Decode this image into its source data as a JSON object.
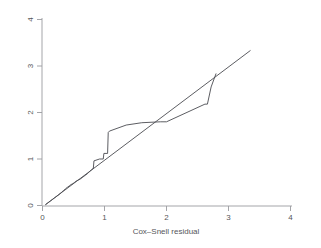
{
  "figure": {
    "background_color": "#ffffff",
    "axis_color": "#9a9b9f",
    "line_color": "#4a4b50"
  },
  "axes": {
    "x_title": "Cox–Snell residual",
    "y_title": "",
    "x_ticks": [
      "0",
      "1",
      "2",
      "3",
      "4"
    ],
    "y_ticks": [
      "0",
      "1",
      "2",
      "3",
      "4"
    ]
  },
  "chart_data": {
    "type": "line",
    "title": "",
    "subtitle": "",
    "xlabel": "Cox–Snell residual",
    "ylabel": "",
    "xlim": [
      0,
      4
    ],
    "ylim": [
      0,
      4
    ],
    "xticks": [
      0,
      1,
      2,
      3,
      4
    ],
    "yticks": [
      0,
      1,
      2,
      3,
      4
    ],
    "grid": false,
    "legend": "none",
    "series": [
      {
        "name": "Nelson-Aalen cumulative hazard (step)",
        "style": "step",
        "points": [
          [
            0.05,
            0.02
          ],
          [
            0.08,
            0.05
          ],
          [
            0.1,
            0.07
          ],
          [
            0.13,
            0.1
          ],
          [
            0.16,
            0.13
          ],
          [
            0.19,
            0.16
          ],
          [
            0.22,
            0.19
          ],
          [
            0.25,
            0.22
          ],
          [
            0.28,
            0.25
          ],
          [
            0.31,
            0.29
          ],
          [
            0.34,
            0.32
          ],
          [
            0.37,
            0.36
          ],
          [
            0.4,
            0.39
          ],
          [
            0.43,
            0.42
          ],
          [
            0.46,
            0.45
          ],
          [
            0.49,
            0.47
          ],
          [
            0.52,
            0.5
          ],
          [
            0.55,
            0.53
          ],
          [
            0.58,
            0.55
          ],
          [
            0.61,
            0.57
          ],
          [
            0.64,
            0.6
          ],
          [
            0.67,
            0.63
          ],
          [
            0.7,
            0.66
          ],
          [
            0.73,
            0.69
          ],
          [
            0.76,
            0.73
          ],
          [
            0.79,
            0.77
          ],
          [
            0.82,
            0.8
          ],
          [
            0.83,
            0.96
          ],
          [
            0.92,
            1.0
          ],
          [
            0.98,
            1.0
          ],
          [
            0.99,
            1.12
          ],
          [
            1.05,
            1.12
          ],
          [
            1.06,
            1.57
          ],
          [
            1.08,
            1.6
          ],
          [
            1.35,
            1.73
          ],
          [
            1.6,
            1.78
          ],
          [
            1.9,
            1.8
          ],
          [
            2.0,
            1.8
          ],
          [
            2.62,
            2.18
          ],
          [
            2.66,
            2.18
          ],
          [
            2.72,
            2.55
          ],
          [
            2.8,
            2.84
          ]
        ]
      },
      {
        "name": "Reference line (45 degrees)",
        "style": "line",
        "points": [
          [
            0.05,
            0.02
          ],
          [
            3.35,
            3.33
          ]
        ]
      }
    ]
  }
}
